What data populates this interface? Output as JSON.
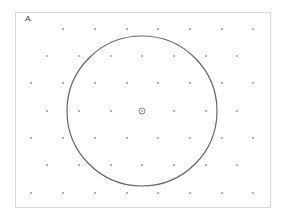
{
  "figure": {
    "label": "A.",
    "colors": {
      "frame": "#d8d8d8",
      "circle": "#666666",
      "dot": "#555555"
    },
    "circle": {
      "cx": 142,
      "cy": 111,
      "r": 75
    },
    "center_marker": {
      "cx": 142,
      "cy": 111,
      "r": 3
    },
    "dot_rows": [
      {
        "y": 29,
        "xs": [
          63,
          95,
          127,
          158,
          190,
          222,
          253
        ]
      },
      {
        "y": 56,
        "xs": [
          47,
          79,
          111,
          142,
          174,
          206,
          237
        ]
      },
      {
        "y": 83,
        "xs": [
          31,
          63,
          95,
          127,
          158,
          190,
          222,
          253
        ]
      },
      {
        "y": 111,
        "xs": [
          47,
          79,
          111,
          174,
          206,
          237
        ]
      },
      {
        "y": 138,
        "xs": [
          31,
          63,
          95,
          127,
          158,
          190,
          222,
          253
        ]
      },
      {
        "y": 165,
        "xs": [
          47,
          79,
          111,
          142,
          174,
          206,
          237
        ]
      },
      {
        "y": 193,
        "xs": [
          31,
          63,
          95,
          127,
          158,
          190,
          222,
          253
        ]
      }
    ]
  }
}
